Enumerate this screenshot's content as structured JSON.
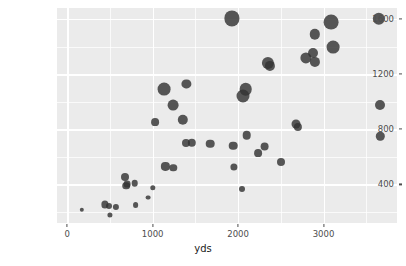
{
  "chart_data": {
    "type": "scatter",
    "title": "",
    "subtitle": "",
    "xlabel": "yds",
    "ylabel": "pa_yds",
    "xlim": [
      -120,
      3860
    ],
    "ylim": [
      120,
      1680
    ],
    "xticks": [
      0,
      1000,
      2000,
      3000
    ],
    "xtick_labels": [
      "0",
      "1000",
      "2000",
      "3000"
    ],
    "yticks": [
      400,
      800,
      1200,
      1600
    ],
    "ytick_labels": [
      "400",
      "800",
      "1200",
      "1600"
    ],
    "x_minor_ticks": [
      500,
      1500,
      2500,
      3500
    ],
    "y_minor_ticks": [
      200,
      600,
      1000,
      1400
    ],
    "grid": true,
    "legend": "none",
    "panel_background": "#ebebeb",
    "grid_color": "#ffffff",
    "point_color": "#333333",
    "point_opacity": 0.82,
    "size_encodes_third_variable": true,
    "points": [
      {
        "x": 170,
        "y": 215,
        "size": 2.2
      },
      {
        "x": 440,
        "y": 255,
        "size": 3.6
      },
      {
        "x": 490,
        "y": 245,
        "size": 3.0
      },
      {
        "x": 500,
        "y": 180,
        "size": 2.6
      },
      {
        "x": 570,
        "y": 235,
        "size": 3.1
      },
      {
        "x": 680,
        "y": 455,
        "size": 4.0
      },
      {
        "x": 690,
        "y": 390,
        "size": 3.8
      },
      {
        "x": 700,
        "y": 405,
        "size": 3.4
      },
      {
        "x": 790,
        "y": 410,
        "size": 3.3
      },
      {
        "x": 800,
        "y": 250,
        "size": 2.9
      },
      {
        "x": 950,
        "y": 305,
        "size": 2.4
      },
      {
        "x": 1000,
        "y": 375,
        "size": 2.7
      },
      {
        "x": 1025,
        "y": 850,
        "size": 3.9
      },
      {
        "x": 1130,
        "y": 1090,
        "size": 6.4
      },
      {
        "x": 1150,
        "y": 530,
        "size": 4.1
      },
      {
        "x": 1240,
        "y": 975,
        "size": 5.4
      },
      {
        "x": 1240,
        "y": 520,
        "size": 3.7
      },
      {
        "x": 1350,
        "y": 870,
        "size": 5.2
      },
      {
        "x": 1395,
        "y": 1130,
        "size": 4.6
      },
      {
        "x": 1395,
        "y": 700,
        "size": 4.0
      },
      {
        "x": 1455,
        "y": 700,
        "size": 4.2
      },
      {
        "x": 1670,
        "y": 695,
        "size": 4.3
      },
      {
        "x": 1930,
        "y": 1605,
        "size": 7.6
      },
      {
        "x": 1945,
        "y": 680,
        "size": 4.3
      },
      {
        "x": 1955,
        "y": 525,
        "size": 3.6
      },
      {
        "x": 2040,
        "y": 365,
        "size": 3.0
      },
      {
        "x": 2055,
        "y": 1040,
        "size": 6.5
      },
      {
        "x": 2090,
        "y": 1090,
        "size": 6.3
      },
      {
        "x": 2100,
        "y": 755,
        "size": 4.3
      },
      {
        "x": 2230,
        "y": 630,
        "size": 3.9
      },
      {
        "x": 2310,
        "y": 675,
        "size": 4.4
      },
      {
        "x": 2350,
        "y": 1280,
        "size": 6.1
      },
      {
        "x": 2375,
        "y": 1260,
        "size": 5.1
      },
      {
        "x": 2500,
        "y": 565,
        "size": 4.0
      },
      {
        "x": 2680,
        "y": 840,
        "size": 4.5
      },
      {
        "x": 2700,
        "y": 820,
        "size": 4.1
      },
      {
        "x": 2790,
        "y": 1320,
        "size": 5.6
      },
      {
        "x": 2880,
        "y": 1350,
        "size": 5.0
      },
      {
        "x": 2895,
        "y": 1490,
        "size": 5.2
      },
      {
        "x": 2900,
        "y": 1290,
        "size": 5.1
      },
      {
        "x": 3090,
        "y": 1575,
        "size": 7.4
      },
      {
        "x": 3115,
        "y": 1395,
        "size": 6.4
      },
      {
        "x": 3650,
        "y": 1600,
        "size": 6.2
      },
      {
        "x": 3665,
        "y": 975,
        "size": 5.0
      },
      {
        "x": 3665,
        "y": 750,
        "size": 4.2
      }
    ]
  },
  "axes": {
    "x_title": "yds",
    "y_title": "pa_yds"
  }
}
